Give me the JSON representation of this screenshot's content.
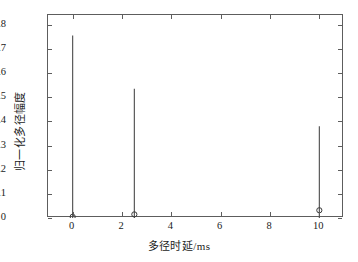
{
  "chart_data": {
    "type": "bar",
    "subtype": "stem",
    "title": "",
    "xlabel": "多径时延/ms",
    "ylabel": "归一化多径幅度",
    "xlim": [
      -1,
      11
    ],
    "ylim": [
      0,
      0.84
    ],
    "xticks": [
      0,
      2,
      4,
      6,
      8,
      10
    ],
    "xticklabels": [
      "0",
      "2",
      "4",
      "6",
      "8",
      "10"
    ],
    "yticks": [
      0,
      0.1,
      0.2,
      0.3,
      0.4,
      0.5,
      0.6,
      0.7,
      0.8
    ],
    "yticklabels": [
      "0",
      "0.1",
      "0.2",
      "0.3",
      "0.4",
      "0.5",
      "0.6",
      "0.7",
      "0.8"
    ],
    "grid": false,
    "legend": null,
    "x": [
      0,
      2.5,
      10
    ],
    "values": [
      0.755,
      0.535,
      0.38
    ],
    "marker_values": [
      0.005,
      0.015,
      0.032
    ],
    "marker": "circle",
    "stem_color": "#4a4a4a",
    "marker_color": "#3a3a3a",
    "axis_color": "#5d5d5d",
    "series": [
      {
        "name": "归一化多径幅度",
        "points": [
          {
            "x": 0,
            "stem_top": 0.755,
            "marker_y": 0.005
          },
          {
            "x": 2.5,
            "stem_top": 0.535,
            "marker_y": 0.015
          },
          {
            "x": 10,
            "stem_top": 0.38,
            "marker_y": 0.032
          }
        ]
      }
    ]
  }
}
